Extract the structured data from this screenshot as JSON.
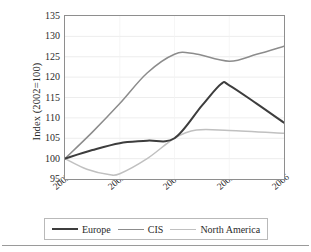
{
  "chart_data": {
    "type": "line",
    "title": "",
    "xlabel": "",
    "ylabel": "Index (2002=100)",
    "x": [
      "2002",
      "2003",
      "2004",
      "2005",
      "2006"
    ],
    "categories": [
      "2002",
      "2003",
      "2004",
      "2005",
      "2006"
    ],
    "xtick_labels": [
      "2002",
      "2003",
      "2004",
      "2005",
      "2006"
    ],
    "ytick_labels": [
      "95",
      "100",
      "105",
      "110",
      "115",
      "120",
      "125",
      "130",
      "135"
    ],
    "ytick_values": [
      95,
      100,
      105,
      110,
      115,
      120,
      125,
      130,
      135
    ],
    "ylim": [
      95,
      135
    ],
    "grid": "horizontal",
    "legend_position": "bottom",
    "smoothing": "spline",
    "series": [
      {
        "name": "Europe",
        "color": "#3d3d3d",
        "width": 2.0,
        "values": [
          100,
          103.8,
          105.0,
          118.0,
          108.8
        ],
        "points": [
          {
            "x": "2002",
            "y": 100
          },
          {
            "x": "2002.5",
            "y": 102.1
          },
          {
            "x": "2003",
            "y": 103.8
          },
          {
            "x": "2003.5",
            "y": 104.4
          },
          {
            "x": "2004",
            "y": 105.0
          },
          {
            "x": "2004.5",
            "y": 113.0
          },
          {
            "x": "2004.85",
            "y": 118.3
          },
          {
            "x": "2005",
            "y": 118.0
          },
          {
            "x": "2005.5",
            "y": 113.5
          },
          {
            "x": "2006",
            "y": 108.8
          }
        ],
        "peak": {
          "x": "2004.85",
          "y": 118.3
        },
        "final": 108.8
      },
      {
        "name": "CIS",
        "color": "#8c8c8c",
        "width": 1.5,
        "values": [
          100,
          113.5,
          125.6,
          123.9,
          127.6
        ],
        "points": [
          {
            "x": "2002",
            "y": 100
          },
          {
            "x": "2002.5",
            "y": 106.5
          },
          {
            "x": "2003",
            "y": 113.5
          },
          {
            "x": "2003.5",
            "y": 121.0
          },
          {
            "x": "2004",
            "y": 125.6
          },
          {
            "x": "2004.35",
            "y": 125.8
          },
          {
            "x": "2005",
            "y": 123.9
          },
          {
            "x": "2005.5",
            "y": 125.6
          },
          {
            "x": "2006",
            "y": 127.6
          }
        ],
        "peak": {
          "x": "2004.35",
          "y": 125.8
        },
        "final": 127.6
      },
      {
        "name": "North America",
        "color": "#c0c0c0",
        "width": 1.5,
        "values": [
          100,
          96.3,
          105.0,
          107.0,
          106.2
        ],
        "points": [
          {
            "x": "2002",
            "y": 100
          },
          {
            "x": "2002.4",
            "y": 97.4
          },
          {
            "x": "2002.8",
            "y": 96.1
          },
          {
            "x": "2003",
            "y": 96.3
          },
          {
            "x": "2003.5",
            "y": 100.0
          },
          {
            "x": "2004",
            "y": 105.0
          },
          {
            "x": "2004.4",
            "y": 107.0
          },
          {
            "x": "2005",
            "y": 106.9
          },
          {
            "x": "2006",
            "y": 106.2
          }
        ],
        "trough": {
          "x": "2002.8",
          "y": 96.1
        },
        "final": 106.2
      }
    ]
  },
  "axes": {
    "ylabel": "Index (2002=100)"
  },
  "legend": {
    "entries": [
      {
        "label": "Europe",
        "color": "#3d3d3d",
        "width": "2px"
      },
      {
        "label": "CIS",
        "color": "#8c8c8c",
        "width": "1.6px"
      },
      {
        "label": "North America",
        "color": "#c0c0c0",
        "width": "1.6px"
      }
    ]
  }
}
